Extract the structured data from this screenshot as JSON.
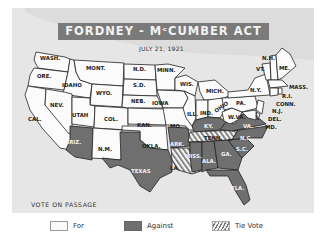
{
  "title": "FORDNEY - MᶜCUMBER ACT",
  "date": "JULY 21, 1921",
  "colors": {
    "for": "#fbfbfb",
    "against": "#6f6f6f",
    "tie": "hatched",
    "background": "#e9e9e9",
    "banner": "#7a7a7a"
  },
  "legend": {
    "title": "VOTE ON PASSAGE",
    "items": [
      {
        "label": "For",
        "style": "for"
      },
      {
        "label": "Against",
        "style": "against"
      },
      {
        "label": "Tie Vote",
        "style": "tie"
      }
    ]
  },
  "states": {
    "for": [
      "WASH.",
      "ORE.",
      "CAL.",
      "IDAHO",
      "NEV.",
      "MONT.",
      "WYO.",
      "UTAH",
      "COL.",
      "N.M.",
      "N.D.",
      "S.D.",
      "NEB.",
      "KAN.",
      "OKLA.",
      "MINN.",
      "IOWA",
      "MO.",
      "WIS.",
      "ILL.",
      "MICH.",
      "IND.",
      "OHIO",
      "W.VA.",
      "PA.",
      "N.Y.",
      "VT.",
      "N.H.",
      "ME.",
      "MASS.",
      "R.I.",
      "CONN.",
      "N.J.",
      "DEL.",
      "MD."
    ],
    "against": [
      "ARIZ.",
      "TEXAS",
      "ARK.",
      "KY.",
      "VA.",
      "N.C.",
      "S.C.",
      "GA.",
      "ALA.",
      "MISS.",
      "FLA."
    ],
    "tie": [
      "LA."
    ]
  },
  "labels": {
    "wash": "WASH.",
    "ore": "ORE.",
    "cal": "CAL.",
    "idaho": "IDAHO",
    "nev": "NEV.",
    "mont": "MONT.",
    "wyo": "WYO.",
    "utah": "UTAH",
    "col": "COL.",
    "ariz": "ARIZ.",
    "nm": "N.M.",
    "nd": "N.D.",
    "sd": "S.D.",
    "neb": "NEB.",
    "kan": "KAN.",
    "okla": "OKLA.",
    "texas": "TEXAS",
    "minn": "MINN.",
    "iowa": "IOWA",
    "mo": "MO.",
    "ark": "ARK.",
    "la": "LA.",
    "wis": "WIS.",
    "ill": "ILL.",
    "mich": "MICH.",
    "ind": "IND.",
    "ohio": "OHIO",
    "ky": "KY.",
    "tenn": "TENN.",
    "miss": "MISS.",
    "ala": "ALA.",
    "ga": "GA.",
    "fla": "FLA.",
    "sc": "S.C.",
    "nc": "N.C.",
    "va": "VA.",
    "wva": "W.VA.",
    "pa": "PA.",
    "ny": "N.Y.",
    "vt": "VT.",
    "nh": "N.H.",
    "me": "ME.",
    "mass": "MASS.",
    "ri": "R.I.",
    "conn": "CONN.",
    "nj": "N.J.",
    "del": "DEL.",
    "md": "MD."
  }
}
